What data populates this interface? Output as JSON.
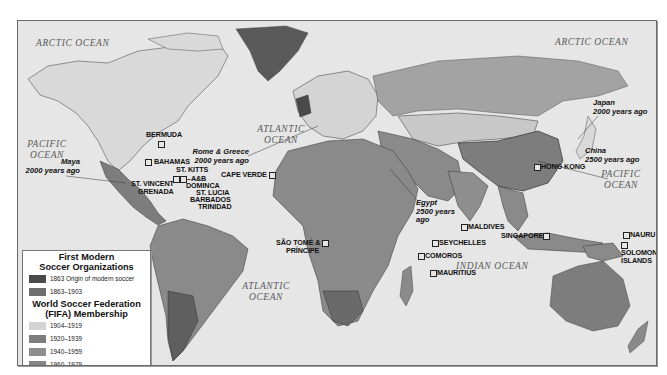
{
  "oceans": [
    {
      "id": "arctic-west",
      "label": "ARCTIC OCEAN"
    },
    {
      "id": "arctic-east",
      "label": "ARCTIC OCEAN"
    },
    {
      "id": "pacific-west",
      "label": "PACIFIC OCEAN"
    },
    {
      "id": "atlantic-north",
      "label": "ATLANTIC OCEAN"
    },
    {
      "id": "pacific-east",
      "label": "PACIFIC OCEAN"
    },
    {
      "id": "indian",
      "label": "INDIAN OCEAN"
    },
    {
      "id": "atlantic-south",
      "label": "ATLANTIC OCEAN"
    }
  ],
  "places": {
    "bermuda": "BERMUDA",
    "bahamas": "BAHAMAS",
    "st_kitts": "ST. KITTS",
    "a_and_b": "A&B",
    "st_vincent": "ST. VINCENT",
    "grenada": "GRENADA",
    "dominica": "DOMINCA",
    "st_lucia": "ST. LUCIA",
    "barbados": "BARBADOS",
    "trinidad": "TRINIDAD",
    "cape_verde": "CAPE VERDE",
    "sao_tome_1": "SÃO TOMÉ &",
    "sao_tome_2": "PRÍNCIPE",
    "maldives": "MALDIVES",
    "seychelles": "SEYCHELLES",
    "comoros": "COMOROS",
    "mauritius": "MAURITIUS",
    "singapore": "SINGAPORE",
    "hong_kong": "HONG KONG",
    "nauru": "NAURU",
    "solomon_1": "SOLOMON",
    "solomon_2": "ISLANDS"
  },
  "annotations": {
    "maya_1": "Maya",
    "maya_2": "2000 years ago",
    "rome_1": "Rome & Greece",
    "rome_2": "2000 years ago",
    "egypt_1": "Egypt",
    "egypt_2": "2500 years",
    "egypt_3": "ago",
    "japan_1": "Japan",
    "japan_2": "2000 years ago",
    "china_1": "China",
    "china_2": "2500 years ago"
  },
  "legend": {
    "section1_title_1": "First Modern",
    "section1_title_2": "Soccer Organizations",
    "section1_items": [
      {
        "label": "1863 Origin of modern soccer",
        "color": "#4a4a4a"
      },
      {
        "label": "1863–1903",
        "color": "#6e6e6e"
      }
    ],
    "section2_title_1": "World Soccer Federation",
    "section2_title_2": "(FIFA) Membership",
    "section2_items": [
      {
        "label": "1904–1919",
        "color": "#d4d4d4"
      },
      {
        "label": "1920–1939",
        "color": "#7d7d7d"
      },
      {
        "label": "1940–1959",
        "color": "#8e8e8e"
      },
      {
        "label": "1960–1979",
        "color": "#868686"
      },
      {
        "label": "1980–1994",
        "color": "#a3a3a3"
      },
      {
        "label": "Post-1994",
        "color": "#c2c2c2"
      }
    ]
  },
  "colors": {
    "water": "#e6e6e6",
    "origin": "#4a4a4a",
    "early": "#6e6e6e",
    "fifa_1904": "#d4d4d4",
    "fifa_1920": "#7d7d7d",
    "fifa_1940": "#8e8e8e",
    "fifa_1960": "#868686",
    "fifa_1980": "#a3a3a3",
    "fifa_post1994": "#c2c2c2"
  }
}
